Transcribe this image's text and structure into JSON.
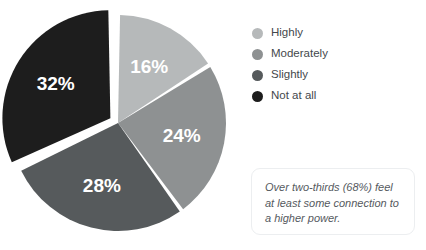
{
  "chart_data": {
    "type": "pie",
    "title": "",
    "categories": [
      "Highly",
      "Moderately",
      "Slightly",
      "Not at all"
    ],
    "values": [
      16,
      24,
      28,
      32
    ],
    "data_labels": [
      "16%",
      "24%",
      "28%",
      "32%"
    ],
    "colors": [
      "#b6b9ba",
      "#8e9192",
      "#565a5c",
      "#1d1d1d"
    ],
    "start_angle_deg": 0,
    "direction": "clockwise",
    "exploded_slices": [
      "Not at all"
    ],
    "legend_position": "right",
    "annotations": [
      "Over two-thirds (68%) feel at least some connection to a higher power."
    ]
  },
  "legend": {
    "items": [
      {
        "label": "Highly",
        "color": "#b6b9ba",
        "swatch_icon": "circle-swatch-icon"
      },
      {
        "label": "Moderately",
        "color": "#8e9192",
        "swatch_icon": "circle-swatch-icon"
      },
      {
        "label": "Slightly",
        "color": "#565a5c",
        "swatch_icon": "circle-swatch-icon"
      },
      {
        "label": "Not at all",
        "color": "#1d1d1d",
        "swatch_icon": "circle-swatch-icon"
      }
    ]
  },
  "callout": {
    "text": "Over two-thirds (68%) feel at least some connection to a higher power."
  }
}
